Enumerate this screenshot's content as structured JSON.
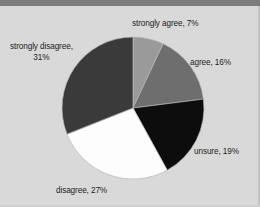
{
  "page": {
    "background_color": "#d9d9d9",
    "topbar_color": "#7c7c7c"
  },
  "chart_data": {
    "type": "pie",
    "title": "",
    "subtitle": "",
    "xlabel": "",
    "ylabel": "",
    "legend_position": "none",
    "grid": false,
    "label_format": "{name}, {value}%",
    "start_angle_deg": 0,
    "direction": "clockwise",
    "categories": [
      "strongly agree",
      "agree",
      "unsure",
      "disagree",
      "strongly disagree"
    ],
    "values": [
      7,
      16,
      19,
      27,
      31
    ],
    "colors": [
      "#9a9a9a",
      "#6e6e6e",
      "#0d0d0d",
      "#fdfdfd",
      "#3a3a3a"
    ],
    "slices": [
      {
        "name": "strongly agree",
        "value": 7,
        "label": "strongly agree, 7%",
        "color": "#9a9a9a",
        "start_deg": 0,
        "end_deg": 25.2
      },
      {
        "name": "agree",
        "value": 16,
        "label": "agree, 16%",
        "color": "#6e6e6e",
        "start_deg": 25.2,
        "end_deg": 82.8
      },
      {
        "name": "unsure",
        "value": 19,
        "label": "unsure, 19%",
        "color": "#0d0d0d",
        "start_deg": 82.8,
        "end_deg": 151.2
      },
      {
        "name": "disagree",
        "value": 27,
        "label": "disagree, 27%",
        "color": "#fdfdfd",
        "start_deg": 151.2,
        "end_deg": 248.4
      },
      {
        "name": "strongly disagree",
        "value": 31,
        "label": "strongly disagree,\n31%",
        "color": "#3a3a3a",
        "start_deg": 248.4,
        "end_deg": 360
      }
    ],
    "labels": {
      "strongly_agree": "strongly agree, 7%",
      "agree": "agree, 16%",
      "unsure": "unsure, 19%",
      "disagree": "disagree, 27%",
      "strongly_disagree": "strongly disagree,\n31%"
    }
  }
}
